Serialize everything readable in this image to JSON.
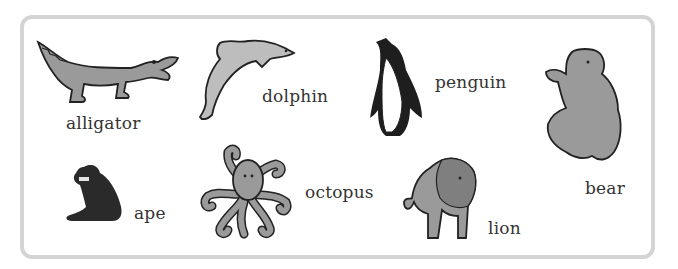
{
  "worksheet": {
    "border_color": "#d4d4d4",
    "animals": [
      {
        "id": "alligator",
        "label": "alligator"
      },
      {
        "id": "dolphin",
        "label": "dolphin"
      },
      {
        "id": "penguin",
        "label": "penguin"
      },
      {
        "id": "bear",
        "label": "bear"
      },
      {
        "id": "ape",
        "label": "ape"
      },
      {
        "id": "octopus",
        "label": "octopus"
      },
      {
        "id": "lion",
        "label": "lion"
      }
    ],
    "illustration_colors": {
      "fill_gray": "#9a9a9a",
      "light_gray": "#c4c4c4",
      "outline": "#222222",
      "dark": "#2a2a2a"
    }
  }
}
